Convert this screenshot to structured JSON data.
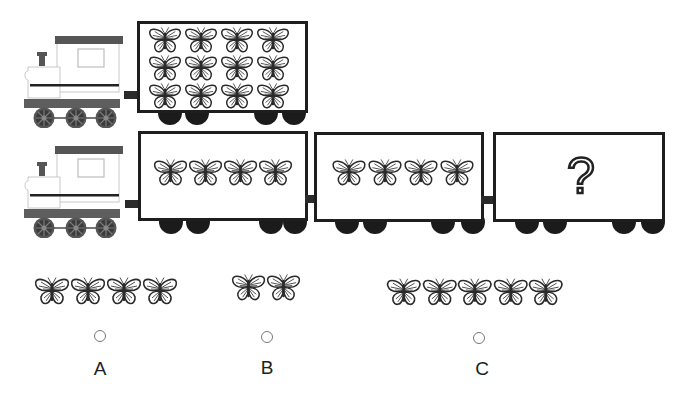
{
  "puzzle": {
    "rows": [
      {
        "name": "reference-train",
        "wagons": [
          {
            "butterflies": 12,
            "layout": "3x4"
          }
        ]
      },
      {
        "name": "question-train",
        "wagons": [
          {
            "butterflies": 4,
            "layout": "1x4"
          },
          {
            "butterflies": 4,
            "layout": "1x4"
          },
          {
            "butterflies": null,
            "symbol": "?"
          }
        ]
      }
    ],
    "question_symbol": "?"
  },
  "options": [
    {
      "label": "A",
      "butterflies": 4,
      "selected": false
    },
    {
      "label": "B",
      "butterflies": 2,
      "selected": false
    },
    {
      "label": "C",
      "butterflies": 5,
      "selected": false
    }
  ],
  "colors": {
    "outline": "#1e1e1e",
    "loco_roof": "#555555",
    "loco_base": "#606060",
    "wheel": "#1b1b1b"
  },
  "icons": {
    "butterfly": "butterfly-icon",
    "locomotive": "locomotive-icon",
    "question": "question-mark-icon"
  }
}
